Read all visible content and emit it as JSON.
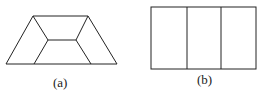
{
  "figures": [
    {
      "id": "a",
      "label": "(a)",
      "shape": "trapezoid divided into inner quadrilateral and three side regions"
    },
    {
      "id": "b",
      "label": "(b)",
      "shape": "rectangle divided into three vertical panels"
    }
  ],
  "colors": {
    "stroke": "#222222",
    "background": "#ffffff"
  }
}
